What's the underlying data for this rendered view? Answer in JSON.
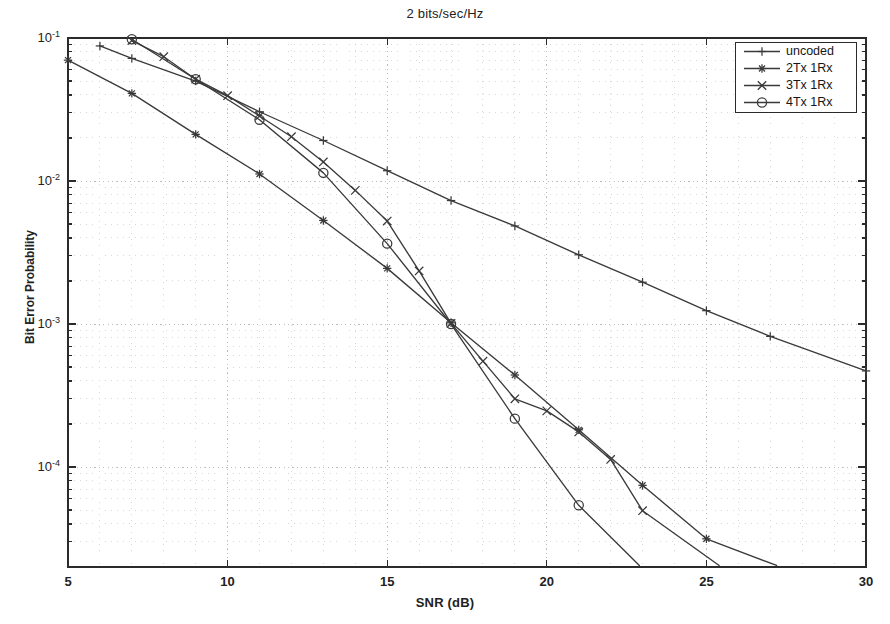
{
  "chart_data": {
    "type": "line",
    "title": "2 bits/sec/Hz",
    "xlabel": "SNR (dB)",
    "ylabel": "Bit Error Probability",
    "xlim": [
      5,
      30
    ],
    "ylim": [
      2e-05,
      0.1
    ],
    "yscale": "log",
    "xticks": [
      5,
      10,
      15,
      20,
      25,
      30
    ],
    "xtick_labels": [
      "5",
      "10",
      "15",
      "20",
      "25",
      "30"
    ],
    "yticks": [
      0.1,
      0.01,
      0.001,
      0.0001
    ],
    "ytick_labels": [
      "10-1",
      "10-2",
      "10-3",
      "10-4"
    ],
    "ytick_mantissa": "10",
    "ytick_exponents": [
      "-1",
      "-2",
      "-3",
      "-4"
    ],
    "grid": "dotted-minor-and-major",
    "legend_position": "upper right",
    "series": [
      {
        "name": "uncoded",
        "marker": "plus",
        "color": "#3a3a3a",
        "x": [
          6,
          7,
          9,
          11,
          13,
          15,
          17,
          19,
          21,
          23,
          25,
          27,
          30
        ],
        "y": [
          0.088,
          0.072,
          0.05,
          0.0305,
          0.0192,
          0.0118,
          0.0073,
          0.00485,
          0.00305,
          0.00196,
          0.00124,
          0.00082,
          0.00047
        ]
      },
      {
        "name": "2Tx 1Rx",
        "marker": "star",
        "color": "#3a3a3a",
        "x": [
          5,
          7,
          9,
          11,
          13,
          15,
          17,
          19,
          21,
          23,
          25,
          27.2
        ],
        "y": [
          0.07,
          0.041,
          0.0212,
          0.0112,
          0.0053,
          0.00245,
          0.00102,
          0.00044,
          0.000182,
          7.45e-05,
          3.15e-05,
          2.05e-05
        ]
      },
      {
        "name": "3Tx 1Rx",
        "marker": "cross",
        "color": "#3a3a3a",
        "x": [
          7,
          8,
          9,
          10,
          11,
          12,
          13,
          14,
          15,
          16,
          17,
          18,
          19,
          20,
          21,
          22,
          23,
          25.4
        ],
        "y": [
          0.096,
          0.074,
          0.0515,
          0.0395,
          0.0285,
          0.0204,
          0.0136,
          0.0086,
          0.00525,
          0.00235,
          0.00101,
          0.00055,
          0.0003,
          0.000247,
          0.000176,
          0.000113,
          4.95e-05,
          2.05e-05
        ]
      },
      {
        "name": "4Tx 1Rx",
        "marker": "circle",
        "color": "#3a3a3a",
        "x": [
          7,
          9,
          11,
          13,
          15,
          17,
          19,
          21,
          22.9
        ],
        "y": [
          0.098,
          0.0515,
          0.0268,
          0.0114,
          0.00365,
          0.001,
          0.000218,
          5.4e-05,
          2.05e-05
        ]
      }
    ]
  },
  "legend": {
    "items": [
      {
        "label": "uncoded",
        "marker": "plus"
      },
      {
        "label": "2Tx 1Rx",
        "marker": "star"
      },
      {
        "label": "3Tx 1Rx",
        "marker": "cross"
      },
      {
        "label": "4Tx 1Rx",
        "marker": "circle"
      }
    ]
  }
}
